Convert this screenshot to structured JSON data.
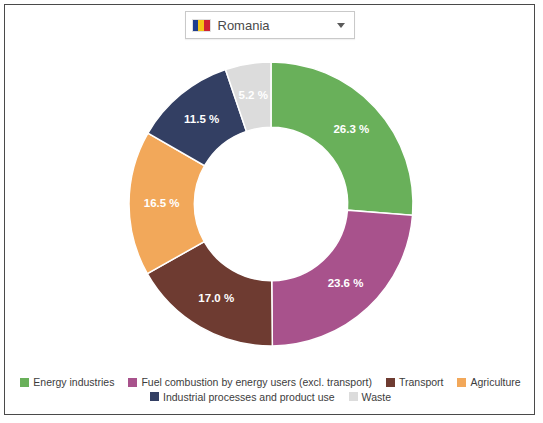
{
  "selector": {
    "name": "country-dropdown",
    "value": "Romania",
    "flag_icon": "romania-flag-icon",
    "caret_icon": "chevron-down-icon"
  },
  "chart_data": {
    "type": "pie",
    "variant": "donut",
    "title": "",
    "subtitle": "",
    "xlabel": "",
    "ylabel": "",
    "legend_position": "bottom",
    "start_angle_deg": 0,
    "direction": "clockwise",
    "inner_radius_ratio": 0.54,
    "value_unit": "%",
    "categories": [
      "Energy industries",
      "Fuel combustion by energy users (excl. transport)",
      "Transport",
      "Agriculture",
      "Industrial processes and product use",
      "Waste"
    ],
    "values": [
      26.3,
      23.6,
      17.0,
      16.5,
      11.5,
      5.2
    ],
    "data_labels": [
      "26.3 %",
      "23.6 %",
      "17.0 %",
      "16.5 %",
      "11.5 %",
      "5.2 %"
    ],
    "colors": [
      "#69b05a",
      "#a8528c",
      "#6e3b31",
      "#f2a85a",
      "#333f63",
      "#dcdcdc"
    ],
    "slices": [
      {
        "label": "Energy industries",
        "value": 26.3,
        "data_label": "26.3 %",
        "color": "#69b05a",
        "label_color": "#ffffff"
      },
      {
        "label": "Fuel combustion by energy users (excl. transport)",
        "value": 23.6,
        "data_label": "23.6 %",
        "color": "#a8528c",
        "label_color": "#ffffff"
      },
      {
        "label": "Transport",
        "value": 17.0,
        "data_label": "17.0 %",
        "color": "#6e3b31",
        "label_color": "#ffffff"
      },
      {
        "label": "Agriculture",
        "value": 16.5,
        "data_label": "16.5 %",
        "color": "#f2a85a",
        "label_color": "#ffffff"
      },
      {
        "label": "Industrial processes and product use",
        "value": 11.5,
        "data_label": "11.5 %",
        "color": "#333f63",
        "label_color": "#ffffff"
      },
      {
        "label": "Waste",
        "value": 5.2,
        "data_label": "5.2 %",
        "color": "#dcdcdc",
        "label_color": "#ffffff"
      }
    ]
  },
  "legend": {
    "rows": [
      [
        {
          "label": "Energy industries",
          "color": "#69b05a"
        },
        {
          "label": "Fuel combustion by energy users (excl. transport)",
          "color": "#a8528c"
        },
        {
          "label": "Transport",
          "color": "#6e3b31"
        },
        {
          "label": "Agriculture",
          "color": "#f2a85a"
        }
      ],
      [
        {
          "label": "Industrial processes and product use",
          "color": "#333f63"
        },
        {
          "label": "Waste",
          "color": "#dcdcdc"
        }
      ]
    ]
  }
}
